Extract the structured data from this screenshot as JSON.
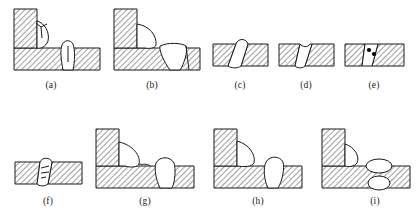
{
  "figure": {
    "panel_count": 9,
    "colors": {
      "line": "#1a1a1a",
      "hatch": "#2b2b2b",
      "parent_metal_fill": "#ffffff",
      "weld_bead_fill": "#ffffff",
      "porosity_fill": "#000000",
      "background": "#ffffff"
    },
    "styles": {
      "stroke_width": "1",
      "hatch_angle_deg": 45,
      "hatch_spacing_px": 4
    }
  },
  "panels": [
    {
      "id": "a",
      "caption": "(a)",
      "joint_type": "tee-joint",
      "members": [
        "vertical-plate",
        "horizontal-plate"
      ],
      "welds": [
        "fillet-weld-left",
        "weld-bead-right"
      ],
      "defects": [
        "toe-crack",
        "centerline-crack"
      ]
    },
    {
      "id": "b",
      "caption": "(b)",
      "joint_type": "tee-joint",
      "members": [
        "vertical-plate",
        "horizontal-plate"
      ],
      "welds": [
        "fillet-weld-left",
        "butt-weld-right"
      ],
      "defects": [
        "lack-of-fusion"
      ]
    },
    {
      "id": "c",
      "caption": "(c)",
      "joint_type": "butt-joint",
      "members": [
        "horizontal-plate"
      ],
      "welds": [
        "single-v-butt-weld"
      ],
      "defects": [
        "excess-reinforcement",
        "root-penetration"
      ]
    },
    {
      "id": "d",
      "caption": "(d)",
      "joint_type": "butt-joint",
      "members": [
        "horizontal-plate"
      ],
      "welds": [
        "single-v-butt-weld"
      ],
      "defects": [
        "incomplete-fill",
        "root-sag"
      ]
    },
    {
      "id": "e",
      "caption": "(e)",
      "joint_type": "butt-joint",
      "members": [
        "horizontal-plate"
      ],
      "welds": [
        "single-v-butt-weld"
      ],
      "defects": [
        "porosity"
      ],
      "porosity_count": 2
    },
    {
      "id": "f",
      "caption": "(f)",
      "joint_type": "butt-joint",
      "members": [
        "horizontal-plate"
      ],
      "welds": [
        "single-v-butt-weld"
      ],
      "defects": [
        "internal-cracks"
      ],
      "crack_count": 3
    },
    {
      "id": "g",
      "caption": "(g)",
      "joint_type": "tee-joint",
      "members": [
        "vertical-plate",
        "horizontal-plate"
      ],
      "welds": [
        "convex-fillet-weld-left",
        "weld-bead-right"
      ],
      "defects": [
        "undercut",
        "excess-convexity"
      ]
    },
    {
      "id": "h",
      "caption": "(h)",
      "joint_type": "tee-joint",
      "members": [
        "vertical-plate",
        "horizontal-plate"
      ],
      "welds": [
        "fillet-weld-left",
        "weld-bead-right"
      ],
      "defects": [
        "overlap",
        "root-penetration"
      ]
    },
    {
      "id": "i",
      "caption": "(i)",
      "joint_type": "tee-joint",
      "members": [
        "vertical-plate",
        "horizontal-plate"
      ],
      "welds": [
        "fillet-weld-left",
        "weld-bead-right-upper",
        "weld-bead-right-lower"
      ],
      "defects": [
        "burn-through",
        "excess-penetration"
      ]
    }
  ],
  "captions": {
    "a": "(a)",
    "b": "(b)",
    "c": "(c)",
    "d": "(d)",
    "e": "(e)",
    "f": "(f)",
    "g": "(g)",
    "h": "(h)",
    "i": "(i)"
  }
}
